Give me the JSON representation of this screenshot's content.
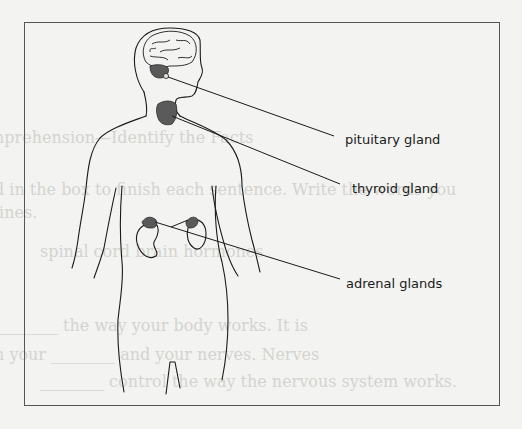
{
  "diagram": {
    "labels": {
      "pituitary": "pituitary gland",
      "thyroid": "thyroid gland",
      "adrenal": "adrenal glands"
    },
    "colors": {
      "frame": "#555555",
      "line": "#1a1a1a",
      "gland_fill": "#5a5a5a",
      "background": "#f3f3f1",
      "bleed_text": "#d3d3d0"
    }
  },
  "background_bleed_text": [
    "nprehension—Identify the Facts",
    "d in the box to finish each sentence. Write the words you",
    "lines.",
    "spinal cord     brain     hormones",
    "________ the way your body works. It is",
    "n your ________ and your nerves. Nerves",
    "________ control the way the nervous system works."
  ]
}
